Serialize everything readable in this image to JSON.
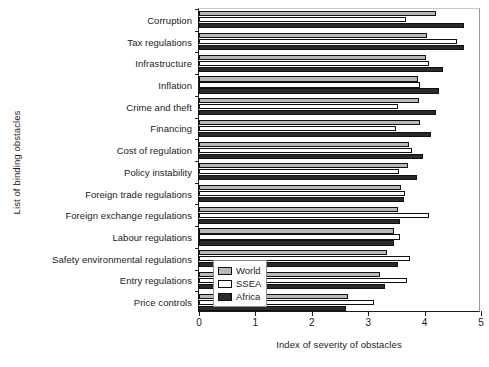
{
  "chart_data": {
    "type": "bar",
    "orientation": "horizontal",
    "title": "",
    "xlabel": "Index of severity of obstacles",
    "ylabel": "List of binding obstacles",
    "xlim": [
      0,
      5
    ],
    "xticks": [
      0,
      1,
      2,
      3,
      4,
      5
    ],
    "xticklabels": [
      "0",
      "1",
      "2",
      "3",
      "4",
      "5"
    ],
    "grid": false,
    "legend_position": "lower right",
    "categories": [
      "Corruption",
      "Tax regulations",
      "Infrastructure",
      "Inflation",
      "Crime and theft",
      "Financing",
      "Cost of regulation",
      "Policy instability",
      "Foreign trade regulations",
      "Foreign exchange regulations",
      "Labour regulations",
      "Safety environmental regulations",
      "Entry regulations",
      "Price controls"
    ],
    "series": [
      {
        "name": "World",
        "color": "#b8b8b8",
        "values": [
          4.2,
          4.05,
          4.03,
          3.89,
          3.9,
          3.92,
          3.72,
          3.7,
          3.58,
          3.52,
          3.46,
          3.33,
          3.21,
          2.65
        ]
      },
      {
        "name": "SSEA",
        "color": "#ffffff",
        "values": [
          3.67,
          4.58,
          4.08,
          3.92,
          3.52,
          3.5,
          3.78,
          3.55,
          3.65,
          4.08,
          3.57,
          3.74,
          3.68,
          3.11
        ]
      },
      {
        "name": "Africa",
        "color": "#2b2b2b",
        "values": [
          4.7,
          4.7,
          4.33,
          4.26,
          4.21,
          4.12,
          3.97,
          3.86,
          3.64,
          3.57,
          3.46,
          3.52,
          3.29,
          2.6
        ]
      }
    ]
  },
  "legend": {
    "entries": [
      {
        "label": "World",
        "key": "world"
      },
      {
        "label": "SSEA",
        "key": "ssea"
      },
      {
        "label": "Africa",
        "key": "africa"
      }
    ]
  }
}
